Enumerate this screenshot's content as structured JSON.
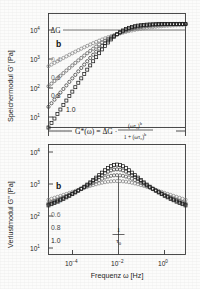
{
  "figure": {
    "panel_letter": "b",
    "equation": {
      "lhs": "G*(ω) = ΔG ·",
      "numerator": "(ωτ₀)",
      "numerator_exp": "b",
      "denominator": "1 + (ωτ₀)",
      "denominator_exp": "b"
    },
    "annotations": {
      "plateau_label": "ΔG",
      "tau_numerator": "1",
      "tau_denominator": "τ",
      "tau_subscript": "0"
    }
  },
  "chart_data": [
    {
      "type": "line",
      "id": "storage-modulus",
      "title": "",
      "xlabel": "Frequenz ω [Hz]",
      "ylabel": "Speichermodul G' [Pa]",
      "xscale": "log",
      "yscale": "log",
      "xlim": [
        1e-05,
        10.0
      ],
      "ylim": [
        10.0,
        20000.0
      ],
      "xticks": [
        "10⁻⁴",
        "10⁻²",
        "10⁰"
      ],
      "xtick_values": [
        0.0001,
        0.01,
        1
      ],
      "yticks": [
        "10¹",
        "10²",
        "10³",
        "10⁴"
      ],
      "ytick_values": [
        10,
        100,
        1000,
        10000
      ],
      "grid": false,
      "legend": "inline-left",
      "delta_G": 10000,
      "tau_0": 100,
      "marker": "open-square-circle",
      "series": [
        {
          "name": "0.4",
          "b": 0.4,
          "color": "#8a8a8a",
          "marker": "open-circle",
          "x": [
            1e-05,
            3.16e-05,
            0.0001,
            0.000316,
            0.001,
            0.00316,
            0.01,
            0.0316,
            0.1,
            0.316,
            1,
            3.16,
            10
          ],
          "y": [
            1000,
            1585,
            2512,
            3548,
            4898,
            6166,
            7079,
            7943,
            8710,
            9120,
            9550,
            9772,
            9900
          ]
        },
        {
          "name": "0.6",
          "b": 0.6,
          "color": "#5c5c5c",
          "marker": "open-circle",
          "x": [
            1e-05,
            3.16e-05,
            0.0001,
            0.000316,
            0.001,
            0.00316,
            0.01,
            0.0316,
            0.1,
            0.316,
            1,
            3.16,
            10
          ],
          "y": [
            282,
            562,
            1122,
            1995,
            3236,
            4786,
            6310,
            7586,
            8511,
            9120,
            9550,
            9772,
            9900
          ]
        },
        {
          "name": "0.8",
          "b": 0.8,
          "color": "#3a3a3a",
          "marker": "open-circle",
          "x": [
            1e-05,
            3.16e-05,
            0.0001,
            0.000316,
            0.001,
            0.00316,
            0.01,
            0.0316,
            0.1,
            0.316,
            1,
            3.16,
            10
          ],
          "y": [
            79,
            200,
            501,
            1122,
            2399,
            4169,
            5888,
            7413,
            8511,
            9120,
            9550,
            9772,
            9900
          ]
        },
        {
          "name": "1.0",
          "b": 1.0,
          "color": "#1a1a1a",
          "marker": "open-square",
          "x": [
            1e-05,
            3.16e-05,
            0.0001,
            0.000316,
            0.001,
            0.00316,
            0.01,
            0.0316,
            0.1,
            0.316,
            1,
            3.16,
            10
          ],
          "y": [
            25,
            79,
            251,
            794,
            1995,
            4169,
            5888,
            7413,
            8511,
            9120,
            9550,
            9772,
            9900
          ]
        }
      ]
    },
    {
      "type": "line",
      "id": "loss-modulus",
      "title": "",
      "xlabel": "Frequenz ω [Hz]",
      "ylabel": "Verlustmodul G'' [Pa]",
      "xscale": "log",
      "yscale": "log",
      "xlim": [
        1e-05,
        10.0
      ],
      "ylim": [
        10.0,
        20000.0
      ],
      "xticks": [
        "10⁻⁴",
        "10⁻²",
        "10⁰"
      ],
      "xtick_values": [
        0.0001,
        0.01,
        1
      ],
      "yticks": [
        "10¹",
        "10²",
        "10³",
        "10⁴"
      ],
      "ytick_values": [
        10,
        100,
        1000,
        10000
      ],
      "grid": false,
      "legend": "inline-left",
      "peak_position": 0.01,
      "series": [
        {
          "name": "0.4",
          "b": 0.4,
          "color": "#8a8a8a",
          "marker": "open-circle",
          "peak": 1600,
          "x": [
            1e-05,
            0.0001,
            0.001,
            0.01,
            0.1,
            1,
            10
          ],
          "y": [
            400,
            700,
            1200,
            1600,
            1200,
            700,
            400
          ]
        },
        {
          "name": "0.6",
          "b": 0.6,
          "color": "#5c5c5c",
          "marker": "open-circle",
          "peak": 2400,
          "x": [
            1e-05,
            0.0001,
            0.001,
            0.01,
            0.1,
            1,
            10
          ],
          "y": [
            170,
            420,
            1100,
            2400,
            1100,
            420,
            170
          ]
        },
        {
          "name": "0.8",
          "b": 0.8,
          "color": "#3a3a3a",
          "marker": "open-circle",
          "peak": 3600,
          "x": [
            1e-05,
            0.0001,
            0.001,
            0.01,
            0.1,
            1,
            10
          ],
          "y": [
            70,
            230,
            850,
            3600,
            850,
            230,
            70
          ]
        },
        {
          "name": "1.0",
          "b": 1.0,
          "color": "#1a1a1a",
          "marker": "open-square",
          "peak": 5000,
          "x": [
            1e-05,
            0.0001,
            0.001,
            0.01,
            0.1,
            1,
            10
          ],
          "y": [
            25,
            100,
            520,
            5000,
            520,
            100,
            25
          ]
        }
      ]
    }
  ]
}
